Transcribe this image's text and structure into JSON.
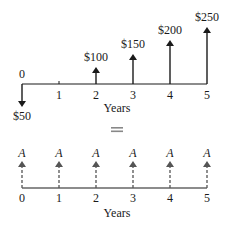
{
  "top_diagram": {
    "axis_label": "Years",
    "origin_label": "0",
    "ticks": [
      "1",
      "2",
      "3",
      "4",
      "5"
    ],
    "outflow": {
      "year": 0,
      "label": "$50"
    },
    "inflows": [
      {
        "year": 2,
        "label": "$100"
      },
      {
        "year": 3,
        "label": "$150"
      },
      {
        "year": 4,
        "label": "$200"
      },
      {
        "year": 5,
        "label": "$250"
      }
    ]
  },
  "equals_sign": "=",
  "bottom_diagram": {
    "axis_label": "Years",
    "ticks": [
      "0",
      "1",
      "2",
      "3",
      "4",
      "5"
    ],
    "annuity_label": "A",
    "annuity_labels": [
      "A",
      "A",
      "A",
      "A",
      "A",
      "A"
    ]
  },
  "colors": {
    "ink": "#1a1a1a",
    "dashed_arrow": "#555555",
    "equals": "#888888"
  }
}
